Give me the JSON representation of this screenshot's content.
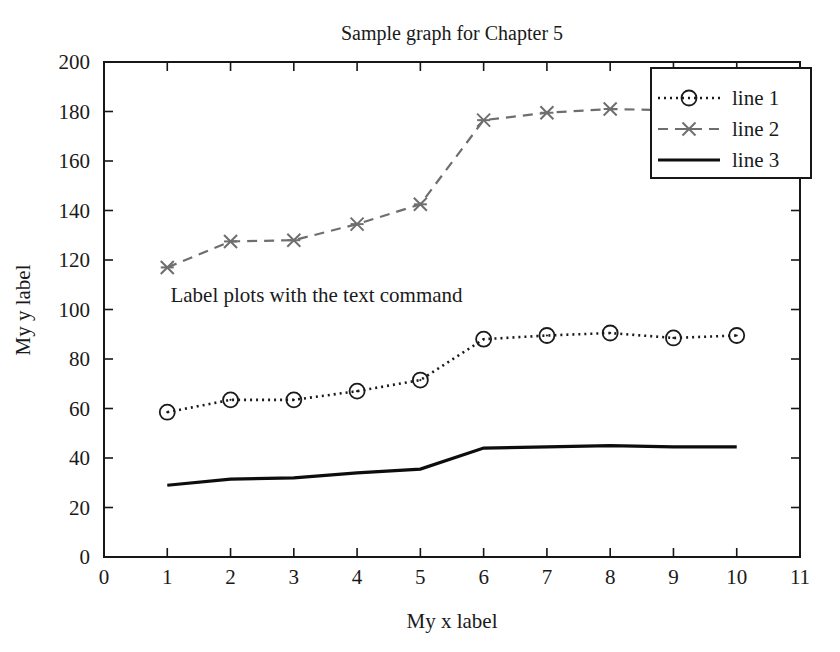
{
  "chart_data": {
    "type": "line",
    "title": "Sample graph for Chapter 5",
    "xlabel": "My x label",
    "ylabel": "My y label",
    "xlim": [
      0,
      11
    ],
    "ylim": [
      0,
      200
    ],
    "xticks": [
      "0",
      "1",
      "2",
      "3",
      "4",
      "5",
      "6",
      "7",
      "8",
      "9",
      "10",
      "11"
    ],
    "yticks": [
      "0",
      "20",
      "40",
      "60",
      "80",
      "100",
      "120",
      "140",
      "160",
      "180",
      "200"
    ],
    "grid": false,
    "legend_position": "upper right",
    "x": [
      1,
      2,
      3,
      4,
      5,
      6,
      7,
      8,
      9,
      10
    ],
    "series": [
      {
        "name": "line 1",
        "values": [
          58.5,
          63.5,
          63.5,
          67,
          71.5,
          88,
          89.5,
          90.5,
          88.5,
          89.5
        ],
        "style": "dotted",
        "marker": "circle",
        "color": "#1a1a1a"
      },
      {
        "name": "line 2",
        "values": [
          117,
          127.5,
          128,
          134.5,
          142.5,
          176.5,
          179.5,
          181,
          180.5,
          179.5
        ],
        "style": "dashed",
        "marker": "asterisk",
        "color": "#6e6e6e"
      },
      {
        "name": "line 3",
        "values": [
          29,
          31.5,
          32,
          34,
          35.5,
          44,
          44.5,
          45,
          44.5,
          44.5
        ],
        "style": "solid",
        "marker": "none",
        "color": "#0d0d0d"
      }
    ],
    "annotations": [
      {
        "text": "Label plots with the text command",
        "x": 1.05,
        "y": 103
      }
    ]
  }
}
